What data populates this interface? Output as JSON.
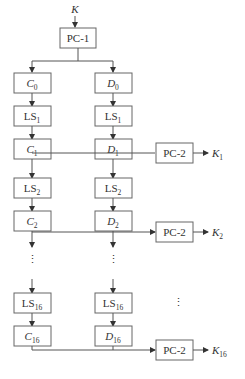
{
  "diagram": {
    "input": {
      "label": "K"
    },
    "pc1": {
      "label": "PC-1"
    },
    "left_column": [
      {
        "kind": "reg",
        "base": "C",
        "sub": "0"
      },
      {
        "kind": "shift",
        "base": "LS",
        "sub": "1"
      },
      {
        "kind": "reg",
        "base": "C",
        "sub": "1"
      },
      {
        "kind": "shift",
        "base": "LS",
        "sub": "2"
      },
      {
        "kind": "reg",
        "base": "C",
        "sub": "2"
      },
      {
        "kind": "shift",
        "base": "LS",
        "sub": "16"
      },
      {
        "kind": "reg",
        "base": "C",
        "sub": "16"
      }
    ],
    "right_column": [
      {
        "kind": "reg",
        "base": "D",
        "sub": "0"
      },
      {
        "kind": "shift",
        "base": "LS",
        "sub": "1"
      },
      {
        "kind": "reg",
        "base": "D",
        "sub": "1"
      },
      {
        "kind": "shift",
        "base": "LS",
        "sub": "2"
      },
      {
        "kind": "reg",
        "base": "D",
        "sub": "2"
      },
      {
        "kind": "shift",
        "base": "LS",
        "sub": "16"
      },
      {
        "kind": "reg",
        "base": "D",
        "sub": "16"
      }
    ],
    "pc2_blocks": [
      {
        "label": "PC-2",
        "output_base": "K",
        "output_sub": "1"
      },
      {
        "label": "PC-2",
        "output_base": "K",
        "output_sub": "2"
      },
      {
        "label": "PC-2",
        "output_base": "K",
        "output_sub": "16"
      }
    ],
    "ellipsis": "⋮",
    "caption": ""
  }
}
